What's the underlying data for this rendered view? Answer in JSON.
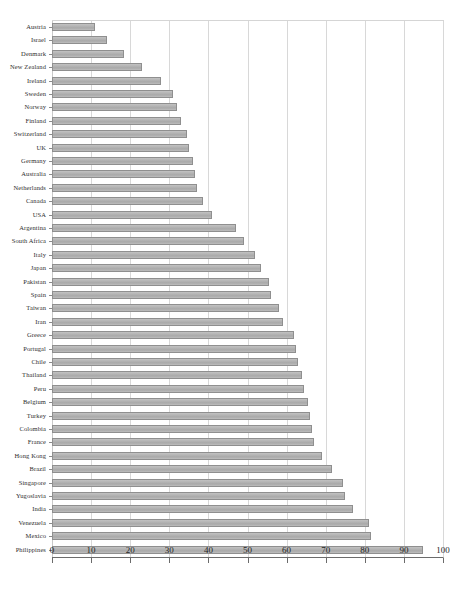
{
  "chart_data": {
    "type": "bar",
    "orientation": "horizontal",
    "title": "",
    "xlabel": "",
    "ylabel": "",
    "xlim": [
      0,
      100
    ],
    "xticks": [
      0,
      10,
      20,
      30,
      40,
      50,
      60,
      70,
      80,
      90,
      100
    ],
    "grid": "vertical",
    "legend": "none",
    "bar_color": "#b4b4b4",
    "bar_border_color": "#8f8f8f",
    "categories": [
      "Austria",
      "Israel",
      "Denmark",
      "New Zealand",
      "Ireland",
      "Sweden",
      "Norway",
      "Finland",
      "Switzerland",
      "UK",
      "Germany",
      "Australia",
      "Netherlands",
      "Canada",
      "USA",
      "Argentina",
      "South Africa",
      "Italy",
      "Japan",
      "Pakistan",
      "Spain",
      "Taiwan",
      "Iran",
      "Greece",
      "Portugal",
      "Chile",
      "Thailand",
      "Peru",
      "Belgium",
      "Turkey",
      "Colombia",
      "France",
      "Hong Kong",
      "Brazil",
      "Singapore",
      "Yugoslavia",
      "India",
      "Venezuela",
      "Mexico",
      "Philippines"
    ],
    "values": [
      11,
      14,
      18.5,
      23,
      28,
      31,
      32,
      33,
      34.5,
      35,
      36,
      36.5,
      37,
      38.5,
      41,
      47,
      49,
      52,
      53.5,
      55.5,
      56,
      58,
      59,
      62,
      62.5,
      63,
      64,
      64.5,
      65.5,
      66,
      66.5,
      67,
      69,
      71.5,
      74.5,
      75,
      77,
      81,
      81.5,
      95
    ]
  },
  "axis": {
    "x_tick_labels": [
      "0",
      "10",
      "20",
      "30",
      "40",
      "50",
      "60",
      "70",
      "80",
      "90",
      "100"
    ]
  }
}
